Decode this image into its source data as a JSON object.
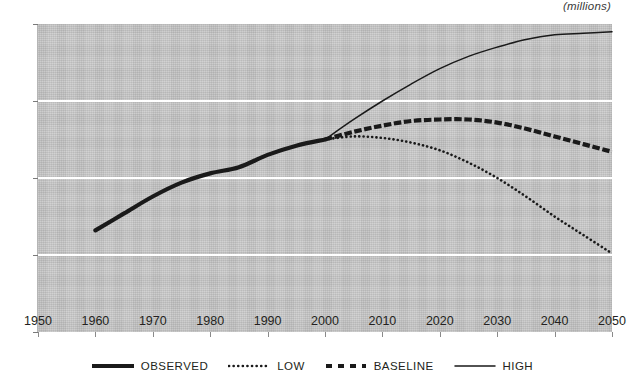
{
  "header": {
    "units_label": "(millions)",
    "clipped_title": ""
  },
  "legend": {
    "position": "bottom-center",
    "items": [
      {
        "label": "OBSERVED",
        "style": "thick-solid",
        "color": "#1a1a1a",
        "name": "legend-item-observed"
      },
      {
        "label": "LOW",
        "style": "fine-dotted",
        "color": "#1a1a1a",
        "name": "legend-item-low"
      },
      {
        "label": "BASELINE",
        "style": "square-dash",
        "color": "#1a1a1a",
        "name": "legend-item-baseline"
      },
      {
        "label": "HIGH",
        "style": "thin-solid",
        "color": "#1a1a1a",
        "name": "legend-item-high"
      }
    ]
  },
  "axes": {
    "y_ticks": [
      "450",
      "400",
      "350",
      "300",
      "250"
    ],
    "x_ticks": [
      "1950",
      "1960",
      "1970",
      "1980",
      "1990",
      "2000",
      "2010",
      "2020",
      "2030",
      "2040",
      "2050"
    ],
    "gridline_values": [
      400,
      350,
      300
    ],
    "plot_bg_color": "#c5c5c5",
    "gridline_color": "#ffffff"
  },
  "chart_data": {
    "type": "line",
    "title": "",
    "subtitle": "",
    "xlabel": "",
    "ylabel": "(millions)",
    "xlim": [
      1950,
      2050
    ],
    "ylim": [
      250,
      450
    ],
    "ytick_step": 50,
    "xtick_step": 10,
    "grid": "horizontal-white",
    "legend_position": "bottom-center",
    "annotations": [
      "(millions)"
    ],
    "series": [
      {
        "name": "OBSERVED",
        "style": "thick-solid",
        "color": "#1a1a1a",
        "x": [
          1960,
          1965,
          1970,
          1975,
          1980,
          1985,
          1990,
          1995,
          2000
        ],
        "values": [
          316,
          327,
          338,
          347,
          353,
          357,
          365,
          371,
          375
        ]
      },
      {
        "name": "LOW",
        "style": "fine-dotted",
        "color": "#1a1a1a",
        "x": [
          2000,
          2005,
          2010,
          2015,
          2020,
          2025,
          2030,
          2035,
          2040,
          2045,
          2050
        ],
        "values": [
          375,
          377,
          376,
          373,
          368,
          360,
          350,
          338,
          325,
          313,
          301
        ]
      },
      {
        "name": "BASELINE",
        "style": "square-dash",
        "color": "#1a1a1a",
        "x": [
          2000,
          2005,
          2010,
          2015,
          2020,
          2025,
          2030,
          2035,
          2040,
          2045,
          2050
        ],
        "values": [
          375,
          380,
          384,
          387,
          388,
          388,
          386,
          382,
          377,
          372,
          367
        ]
      },
      {
        "name": "HIGH",
        "style": "thin-solid",
        "color": "#1a1a1a",
        "x": [
          2000,
          2005,
          2010,
          2015,
          2020,
          2025,
          2030,
          2035,
          2040,
          2045,
          2050
        ],
        "values": [
          375,
          388,
          400,
          411,
          421,
          429,
          435,
          440,
          443,
          444,
          445
        ]
      }
    ]
  }
}
